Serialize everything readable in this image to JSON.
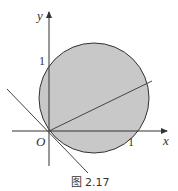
{
  "figure": {
    "caption": "图 2.17",
    "axes": {
      "x_label": "x",
      "y_label": "y",
      "origin_label": "O",
      "x_tick_label": "1",
      "y_tick_label": "1"
    },
    "circle": {
      "fill_color": "#c8c8c8",
      "stroke_color": "#333333"
    },
    "line_color": "#444444"
  }
}
